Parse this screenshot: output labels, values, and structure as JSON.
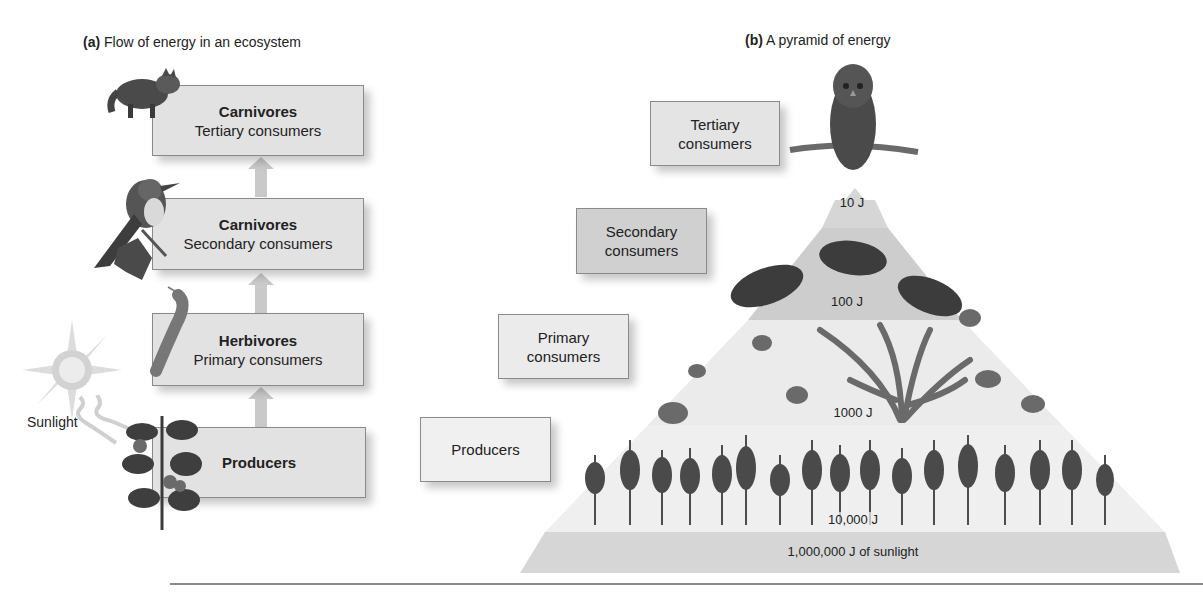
{
  "panel_a": {
    "label": "(a)",
    "title": "Flow of energy in an ecosystem",
    "sunlight_label": "Sunlight",
    "levels": [
      {
        "bold": "Carnivores",
        "sub": "Tertiary consumers",
        "organism": "raccoon"
      },
      {
        "bold": "Carnivores",
        "sub": "Secondary consumers",
        "organism": "bird"
      },
      {
        "bold": "Herbivores",
        "sub": "Primary consumers",
        "organism": "caterpillar"
      },
      {
        "bold": "Producers",
        "sub": "",
        "organism": "tomato-plant"
      }
    ]
  },
  "panel_b": {
    "label": "(b)",
    "title": "A pyramid of energy",
    "level_boxes": [
      {
        "line1": "Tertiary",
        "line2": "consumers"
      },
      {
        "line1": "Secondary",
        "line2": "consumers"
      },
      {
        "line1": "Primary",
        "line2": "consumers"
      },
      {
        "line1": "Producers",
        "line2": ""
      }
    ],
    "energy_labels": [
      "10 J",
      "100 J",
      "1000 J",
      "10,000 J"
    ],
    "sunlight_band": "1,000,000 J of sunlight",
    "organisms": [
      "owl",
      "moles",
      "snails",
      "plants"
    ]
  },
  "colors": {
    "box_fill": "#e2e2e2",
    "box_border": "#8a8a8a",
    "arrow": "#c8c8c8",
    "band_top": "#d8d8d8",
    "band_secondary": "#cbcbcb",
    "band_primary": "#ededed",
    "band_producers": "#f0f0f0",
    "band_sunlight": "#d6d6d6"
  }
}
